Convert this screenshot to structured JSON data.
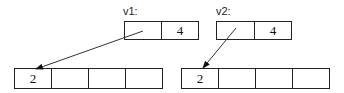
{
  "diagram": {
    "vectors": [
      {
        "label": "v1:",
        "cells": [
          "",
          "4"
        ]
      },
      {
        "label": "v2:",
        "cells": [
          "",
          "4"
        ]
      }
    ],
    "arrays": [
      {
        "cells": [
          "2",
          "",
          "",
          ""
        ]
      },
      {
        "cells": [
          "2",
          "",
          "",
          ""
        ]
      }
    ],
    "arrows": [
      {
        "from": "v1.cell0",
        "to": "array0.cell0"
      },
      {
        "from": "v2.cell0",
        "to": "array1.cell0"
      }
    ]
  }
}
